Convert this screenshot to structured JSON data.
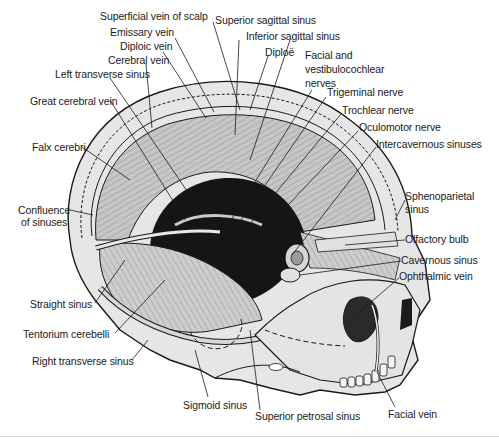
{
  "figure": {
    "colors": {
      "ink": "#1a1a1a",
      "bone": "#e4e4e4",
      "dura": "#bdbdbd",
      "dark": "#151515",
      "bg": "#ffffff"
    }
  },
  "labels": [
    {
      "id": "superficial-vein-of-scalp",
      "text": "Superficial vein of scalp",
      "x": 100,
      "y": 15
    },
    {
      "id": "superior-sagittal-sinus",
      "text": "Superior sagittal sinus",
      "x": 215,
      "y": 19
    },
    {
      "id": "emissary-vein",
      "text": "Emissary vein",
      "x": 110,
      "y": 31
    },
    {
      "id": "inferior-sagittal-sinus",
      "text": "Inferior sagittal sinus",
      "x": 246,
      "y": 35
    },
    {
      "id": "diploic-vein",
      "text": "Diploic vein",
      "x": 120,
      "y": 45
    },
    {
      "id": "diploe",
      "text": "Diploë",
      "x": 265,
      "y": 51
    },
    {
      "id": "cerebral-vein",
      "text": "Cerebral vein",
      "x": 108,
      "y": 59
    },
    {
      "id": "facial-vestibulocochlear-nerves",
      "text": "Facial and\nvestibulocochlear\nnerves",
      "x": 305,
      "y": 51
    },
    {
      "id": "left-transverse-sinus",
      "text": "Left transverse sinus",
      "x": 55,
      "y": 73
    },
    {
      "id": "trigeminal-nerve",
      "text": "Trigeminal nerve",
      "x": 327,
      "y": 92
    },
    {
      "id": "great-cerebral-vein",
      "text": "Great cerebral vein",
      "x": 30,
      "y": 95
    },
    {
      "id": "trochlear-nerve",
      "text": "Trochlear nerve",
      "x": 342,
      "y": 109
    },
    {
      "id": "oculomotor-nerve",
      "text": "Oculomotor nerve",
      "x": 359,
      "y": 126
    },
    {
      "id": "falx-cerebri",
      "text": "Falx cerebri",
      "x": 32,
      "y": 141
    },
    {
      "id": "intercavernous-sinuses",
      "text": "Intercavernous sinuses",
      "x": 376,
      "y": 142
    },
    {
      "id": "confluence-of-sinuses",
      "text": "Confluence\nof sinuses",
      "x": 20,
      "y": 204
    },
    {
      "id": "sphenoparietal-sinus",
      "text": "Sphenoparietal\nsinus",
      "x": 405,
      "y": 193
    },
    {
      "id": "olfactory-bulb",
      "text": "Olfactory bulb",
      "x": 405,
      "y": 234
    },
    {
      "id": "cavernous-sinus",
      "text": "Cavernous sinus",
      "x": 401,
      "y": 256
    },
    {
      "id": "ophthalmic-vein",
      "text": "Ophthalmic vein",
      "x": 399,
      "y": 273
    },
    {
      "id": "straight-sinus",
      "text": "Straight sinus",
      "x": 30,
      "y": 297
    },
    {
      "id": "tentorium-cerebelli",
      "text": "Tentorium cerebelli",
      "x": 23,
      "y": 327
    },
    {
      "id": "right-transverse-sinus",
      "text": "Right transverse sinus",
      "x": 32,
      "y": 356
    },
    {
      "id": "sigmoid-sinus",
      "text": "Sigmoid sinus",
      "x": 183,
      "y": 398
    },
    {
      "id": "superior-petrosal-sinus",
      "text": "Superior petrosal sinus",
      "x": 255,
      "y": 411
    },
    {
      "id": "facial-vein",
      "text": "Facial vein",
      "x": 388,
      "y": 409
    }
  ]
}
